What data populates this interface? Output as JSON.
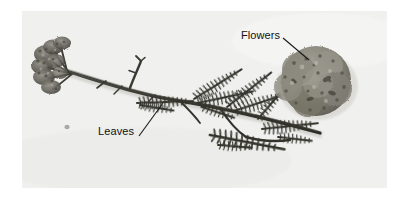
{
  "figure": {
    "type": "labeled-photograph",
    "background_color": "#ffffff",
    "photo": {
      "background_color": "#f3f3f2",
      "x": 22,
      "y": 11,
      "width": 365,
      "height": 177
    }
  },
  "callouts": [
    {
      "id": "flowers",
      "label": "Flowers",
      "label_x": 241,
      "label_y": 29,
      "leader_line": {
        "x1": 283,
        "y1": 38,
        "x2": 309,
        "y2": 60
      },
      "color": "#111111"
    },
    {
      "id": "leaves",
      "label": "Leaves",
      "label_x": 98,
      "label_y": 125,
      "leader_line": {
        "x1": 139,
        "y1": 136,
        "x2": 163,
        "y2": 103
      },
      "color": "#111111"
    }
  ],
  "specimen": {
    "parts": [
      {
        "name": "left-flower-cluster",
        "description": "flat-topped corymb of small flowers"
      },
      {
        "name": "main-stem",
        "description": "horizontal branching stem"
      },
      {
        "name": "leaves",
        "description": "finely divided feathery pinnate leaves"
      },
      {
        "name": "detached-flower-head",
        "description": "dense rounded flower head close-up"
      },
      {
        "name": "debris-speck",
        "description": "small dark speck on background"
      }
    ],
    "tone": "grayscale"
  }
}
